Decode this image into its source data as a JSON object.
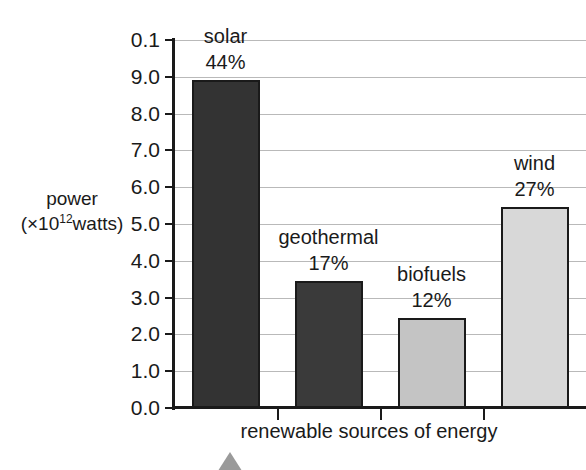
{
  "chart_data": {
    "type": "bar",
    "title": "",
    "xlabel": "renewable sources of energy",
    "ylabel_line1": "power",
    "ylabel_line2_prefix": "(×10",
    "ylabel_line2_sup": "12",
    "ylabel_line2_suffix": "watts)",
    "categories": [
      "solar",
      "geothermal",
      "biofuels",
      "wind"
    ],
    "values": [
      8.9,
      3.45,
      2.45,
      5.45
    ],
    "percent_labels": [
      "44%",
      "17%",
      "12%",
      "27%"
    ],
    "bar_colors": [
      "#333333",
      "#3a3a3a",
      "#c4c4c4",
      "#d8d8d8"
    ],
    "bar_border_color": "#1a1a1a",
    "ylim": [
      0.0,
      10.0
    ],
    "grid": true,
    "legend": "none",
    "y_tick_labels": [
      "0.1",
      "9.0",
      "8.0",
      "7.0",
      "6.0",
      "5.0",
      "4.0",
      "3.0",
      "2.0",
      "1.0",
      "0.0"
    ],
    "y_tick_values": [
      10.0,
      9.0,
      8.0,
      7.0,
      6.0,
      5.0,
      4.0,
      3.0,
      2.0,
      1.0,
      0.0
    ],
    "axis_color": "#1a1a1a",
    "grid_color": "#b9b9b9",
    "background": "#ffffff",
    "pointer_marker_color": "#9a9a9a"
  },
  "axes": {
    "y_title_line1": "power",
    "y_title_line2_prefix": "(×10",
    "y_title_line2_sup": "12",
    "y_title_line2_suffix": "watts)",
    "x_title": "renewable sources of energy"
  },
  "ticks": {
    "y": [
      {
        "label": "0.1",
        "value": 10.0
      },
      {
        "label": "9.0",
        "value": 9.0
      },
      {
        "label": "8.0",
        "value": 8.0
      },
      {
        "label": "7.0",
        "value": 7.0
      },
      {
        "label": "6.0",
        "value": 6.0
      },
      {
        "label": "5.0",
        "value": 5.0
      },
      {
        "label": "4.0",
        "value": 4.0
      },
      {
        "label": "3.0",
        "value": 3.0
      },
      {
        "label": "2.0",
        "value": 2.0
      },
      {
        "label": "1.0",
        "value": 1.0
      },
      {
        "label": "0.0",
        "value": 0.0
      }
    ]
  },
  "bars": [
    {
      "name": "solar",
      "label": "solar",
      "percent": "44%",
      "value": 8.9,
      "color": "#333333"
    },
    {
      "name": "geothermal",
      "label": "geothermal",
      "percent": "17%",
      "value": 3.45,
      "color": "#3a3a3a"
    },
    {
      "name": "biofuels",
      "label": "biofuels",
      "percent": "12%",
      "value": 2.45,
      "color": "#c4c4c4"
    },
    {
      "name": "wind",
      "label": "wind",
      "percent": "27%",
      "value": 5.45,
      "color": "#d8d8d8"
    }
  ]
}
